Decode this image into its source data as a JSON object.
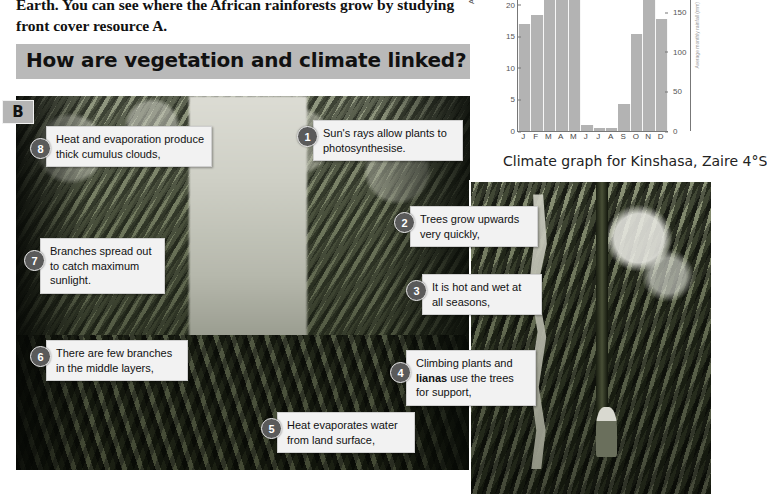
{
  "intro": {
    "paragraph": "Earth. You can see where the African rainforests grow by studying front cover resource A."
  },
  "heading": {
    "text": "How are vegetation and climate linked?"
  },
  "figure": {
    "label": "B",
    "main_photo_alt": "tropical-rainforest-interior",
    "inset_photo_alt": "liana-vine-and-person-in-rainforest"
  },
  "callouts": [
    {
      "num": "1",
      "text": "Sun's rays allow plants to photosynthesise."
    },
    {
      "num": "2",
      "text": "Trees grow upwards very quickly,"
    },
    {
      "num": "3",
      "text": "It is hot and wet at all seasons,"
    },
    {
      "num": "4",
      "text_before": "Climbing plants and ",
      "bold": "lianas",
      "text_after": " use the trees for support,"
    },
    {
      "num": "5",
      "text": "Heat evaporates water from land surface,"
    },
    {
      "num": "6",
      "text": "There are few branches in the middle layers,"
    },
    {
      "num": "7",
      "text": "Branches spread out to catch maximum sunlight."
    },
    {
      "num": "8",
      "text": "Heat and evaporation produce thick cumulus clouds,"
    }
  ],
  "chart_data": {
    "type": "bar",
    "title": "",
    "caption": "Climate graph for Kinshasa, Zaire 4°S",
    "categories": [
      "J",
      "F",
      "M",
      "A",
      "M",
      "J",
      "J",
      "A",
      "S",
      "O",
      "N",
      "D"
    ],
    "values": [
      135,
      146,
      196,
      197,
      165,
      8,
      4,
      4,
      34,
      123,
      192,
      142
    ],
    "ylabel": "Average monthly temperature",
    "ylabel_right": "Average monthly rainfall (mm)",
    "xlabel": "",
    "ylim": [
      0,
      183
    ],
    "yticks_left": [
      0,
      5,
      10,
      15,
      20
    ],
    "ylim_right": [
      0,
      183
    ],
    "yticks_right": [
      0,
      50,
      100,
      150
    ],
    "grid": false,
    "legend": "none",
    "bar_color": "#b3b3b3"
  }
}
